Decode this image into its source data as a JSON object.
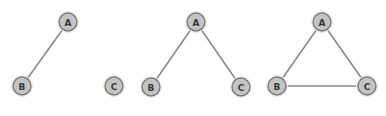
{
  "diagram": {
    "panels": [
      {
        "nodes": [
          {
            "id": "A",
            "label": "A",
            "x": 68,
            "y": 22
          },
          {
            "id": "B",
            "label": "B",
            "x": 22,
            "y": 86
          },
          {
            "id": "C",
            "label": "C",
            "x": 114,
            "y": 86
          }
        ],
        "edges": [
          [
            "A",
            "B"
          ]
        ]
      },
      {
        "nodes": [
          {
            "id": "A",
            "label": "A",
            "x": 196,
            "y": 22
          },
          {
            "id": "B",
            "label": "B",
            "x": 151,
            "y": 87
          },
          {
            "id": "C",
            "label": "C",
            "x": 241,
            "y": 87
          }
        ],
        "edges": [
          [
            "A",
            "B"
          ],
          [
            "A",
            "C"
          ]
        ]
      },
      {
        "nodes": [
          {
            "id": "A",
            "label": "A",
            "x": 322,
            "y": 22
          },
          {
            "id": "B",
            "label": "B",
            "x": 277,
            "y": 86
          },
          {
            "id": "C",
            "label": "C",
            "x": 367,
            "y": 86
          }
        ],
        "edges": [
          [
            "A",
            "B"
          ],
          [
            "A",
            "C"
          ],
          [
            "B",
            "C"
          ]
        ]
      }
    ],
    "colors": {
      "node_fill": "#c4c4c4",
      "node_stroke": "#7a7a7a",
      "edge": "#8a8a8a",
      "label": "#3a3a3a"
    },
    "node_radius": 9
  }
}
